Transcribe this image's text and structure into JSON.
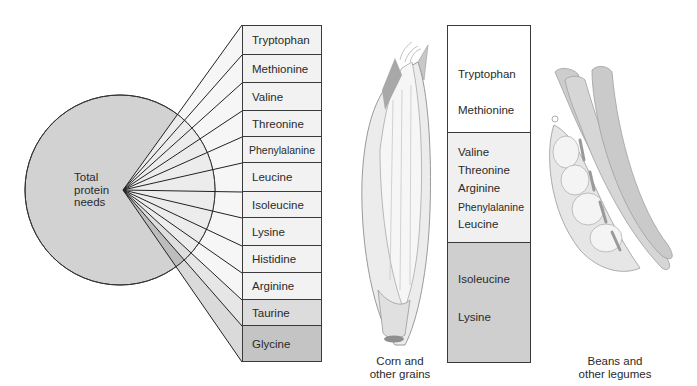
{
  "pie": {
    "label_lines": [
      "Total",
      "protein",
      "needs"
    ],
    "fill": "#d2d2d2"
  },
  "amino_acids": {
    "items": [
      {
        "label": "Tryptophan",
        "fill": "#f2f2f2"
      },
      {
        "label": "Methionine",
        "fill": "#f2f2f2"
      },
      {
        "label": "Valine",
        "fill": "#f2f2f2"
      },
      {
        "label": "Threonine",
        "fill": "#f2f2f2"
      },
      {
        "label": "Phenylalanine",
        "fill": "#f2f2f2"
      },
      {
        "label": "Leucine",
        "fill": "#f2f2f2"
      },
      {
        "label": "Isoleucine",
        "fill": "#f2f2f2"
      },
      {
        "label": "Lysine",
        "fill": "#f2f2f2"
      },
      {
        "label": "Histidine",
        "fill": "#f2f2f2"
      },
      {
        "label": "Arginine",
        "fill": "#f2f2f2"
      },
      {
        "label": "Taurine",
        "fill": "#dcdcdc"
      },
      {
        "label": "Glycine",
        "fill": "#c4c4c4"
      }
    ]
  },
  "corn": {
    "caption_lines": [
      "Corn and",
      "other grains"
    ]
  },
  "comparison_table": {
    "sections": [
      {
        "items": [
          "Tryptophan",
          "Methionine"
        ],
        "fill": "#ffffff"
      },
      {
        "items": [
          "Valine",
          "Threonine",
          "Arginine",
          "Phenylalanine",
          "Leucine"
        ],
        "fill": "#f0f0f0"
      },
      {
        "items": [
          "Isoleucine",
          "Lysine"
        ],
        "fill": "#cfcfcf"
      }
    ]
  },
  "beans": {
    "caption_lines": [
      "Beans and",
      "other legumes"
    ]
  }
}
